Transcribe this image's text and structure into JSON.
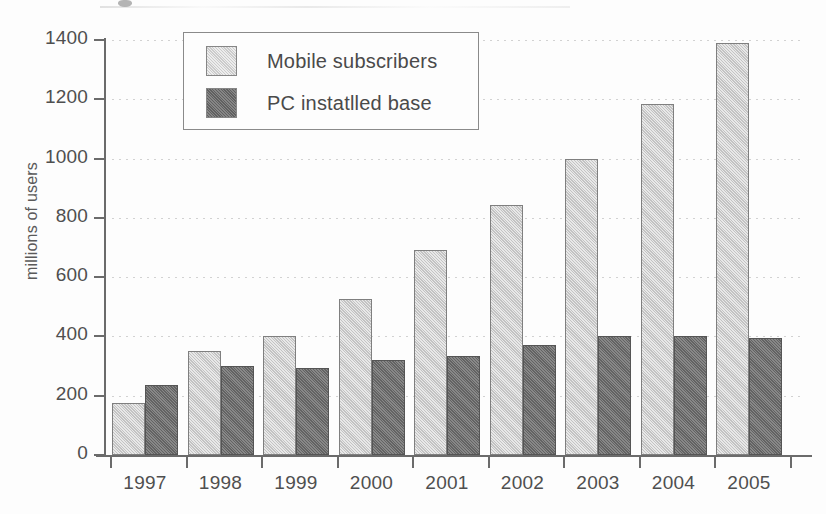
{
  "figure": {
    "background_color": "#fdfdfd",
    "caption_artifact": "",
    "axis_color": "#6b6b6b",
    "text_color": "#4a4a4a"
  },
  "legend": {
    "position": "top-left-inside",
    "entries": [
      {
        "label": "Mobile subscribers",
        "color": "#cdcdcd",
        "swatch": "light-square"
      },
      {
        "label": "PC instatlled base",
        "color": "#6e6e6e",
        "swatch": "dark-square"
      }
    ]
  },
  "axes": {
    "y_title": "millions of users",
    "y_ticks": [
      "1400",
      "1200",
      "1000",
      "800",
      "600",
      "400",
      "200",
      "0"
    ],
    "x_ticks": [
      "1997",
      "1998",
      "1999",
      "2000",
      "2001",
      "2002",
      "2003",
      "2004",
      "2005"
    ]
  },
  "chart_data": {
    "type": "bar",
    "title": "",
    "xlabel": "",
    "ylabel": "millions of users",
    "ylim": [
      0,
      1400
    ],
    "ytick_step": 200,
    "grid": true,
    "legend_position": "upper left",
    "categories": [
      "1997",
      "1998",
      "1999",
      "2000",
      "2001",
      "2002",
      "2003",
      "2004",
      "2005"
    ],
    "series": [
      {
        "name": "Mobile subscribers",
        "color": "#cdcdcd",
        "values": [
          175,
          350,
          400,
          525,
          690,
          845,
          1000,
          1185,
          1390
        ]
      },
      {
        "name": "PC instatlled base",
        "color": "#6e6e6e",
        "values": [
          235,
          300,
          295,
          320,
          335,
          370,
          400,
          400,
          395
        ]
      }
    ]
  }
}
